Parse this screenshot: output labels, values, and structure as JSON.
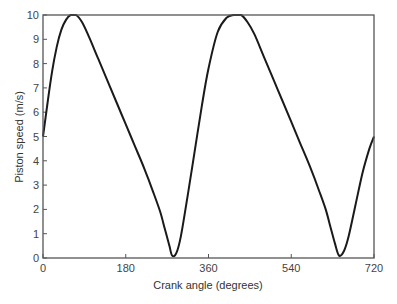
{
  "chart_data": {
    "type": "line",
    "title": "",
    "xlabel": "Crank angle (degrees)",
    "ylabel": "Piston speed (m/s)",
    "xlim": [
      0,
      720
    ],
    "ylim": [
      0,
      10
    ],
    "xticks": [
      0,
      180,
      360,
      540,
      720
    ],
    "yticks": [
      0,
      1,
      2,
      3,
      4,
      5,
      6,
      7,
      8,
      9,
      10
    ],
    "grid": false,
    "legend": null,
    "series": [
      {
        "name": "Piston speed",
        "color": "#1a1a1a",
        "x": [
          0,
          10,
          20,
          30,
          40,
          50,
          60,
          72,
          85,
          100,
          120,
          140,
          160,
          180,
          200,
          220,
          240,
          255,
          265,
          275,
          281,
          290,
          300,
          315,
          330,
          345,
          360,
          380,
          400,
          415,
          431,
          445,
          460,
          480,
          500,
          520,
          540,
          560,
          580,
          600,
          615,
          625,
          635,
          644,
          655,
          665,
          680,
          695,
          710,
          720
        ],
        "y": [
          5.0,
          6.4,
          7.7,
          8.7,
          9.4,
          9.8,
          10.0,
          10.0,
          9.7,
          9.1,
          8.2,
          7.3,
          6.4,
          5.5,
          4.6,
          3.7,
          2.7,
          1.9,
          1.2,
          0.5,
          0.1,
          0.2,
          0.9,
          2.6,
          4.4,
          6.2,
          7.8,
          9.3,
          9.9,
          10.0,
          10.0,
          9.7,
          9.2,
          8.3,
          7.4,
          6.5,
          5.6,
          4.7,
          3.8,
          2.8,
          2.0,
          1.3,
          0.6,
          0.1,
          0.3,
          0.9,
          2.2,
          3.5,
          4.5,
          5.0
        ]
      }
    ]
  }
}
